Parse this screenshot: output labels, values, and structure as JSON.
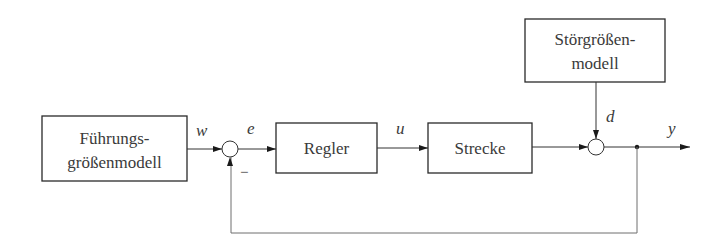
{
  "diagram": {
    "type": "control-loop-block-diagram",
    "blocks": {
      "reference_model": {
        "line1": "Führungs-",
        "line2": "größenmodell"
      },
      "controller": {
        "label": "Regler"
      },
      "plant": {
        "label": "Strecke"
      },
      "disturbance_model": {
        "line1": "Störgrößen-",
        "line2": "modell"
      }
    },
    "signals": {
      "reference": "w",
      "error": "e",
      "control": "u",
      "disturbance": "d",
      "output": "y"
    },
    "feedback_sign": "−",
    "colors": {
      "stroke": "#2a2a2a",
      "text": "#3a3a3a",
      "background": "#ffffff"
    }
  }
}
